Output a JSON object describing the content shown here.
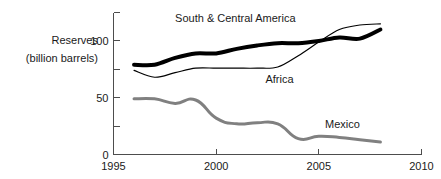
{
  "chart_data": {
    "type": "line",
    "title": "",
    "xlabel": "",
    "ylabel": "Reserves (billion barrels)",
    "ylabel_line1": "Reserves",
    "ylabel_line2": "(billion barrels)",
    "xlim": [
      1995,
      2010
    ],
    "ylim": [
      0,
      125
    ],
    "grid": false,
    "legend_position": "inline-annotation",
    "x_ticks": [
      1995,
      2000,
      2005,
      2010
    ],
    "x_tick_labels": [
      "1995",
      "2000",
      "2005",
      "2010"
    ],
    "y_ticks": [
      0,
      50,
      100
    ],
    "y_tick_labels": [
      "0",
      "50",
      "100"
    ],
    "y_minor_ticks": [
      25,
      75,
      125
    ],
    "x": [
      1996,
      1997,
      1998,
      1999,
      2000,
      2001,
      2002,
      2003,
      2004,
      2005,
      2006,
      2007,
      2008
    ],
    "series": [
      {
        "name": "South & Central America",
        "label": "South & Central America",
        "color": "#000000",
        "width": 4,
        "label_x": 1998.0,
        "label_y": 117,
        "values": [
          79,
          79,
          85,
          89,
          89,
          93,
          96,
          98,
          98,
          100,
          103,
          102,
          110
        ]
      },
      {
        "name": "Africa",
        "label": "Africa",
        "color": "#000000",
        "width": 1.2,
        "label_x": 2002.4,
        "label_y": 63,
        "values": [
          74,
          68,
          72,
          76,
          76,
          76,
          76,
          77,
          87,
          99,
          110,
          114,
          115
        ]
      },
      {
        "name": "Mexico",
        "label": "Mexico",
        "color": "#808080",
        "width": 3,
        "label_x": 2005.3,
        "label_y": 23,
        "values": [
          49,
          49,
          45,
          48,
          32,
          27,
          28,
          27,
          14,
          16,
          15,
          13,
          11
        ]
      }
    ]
  }
}
